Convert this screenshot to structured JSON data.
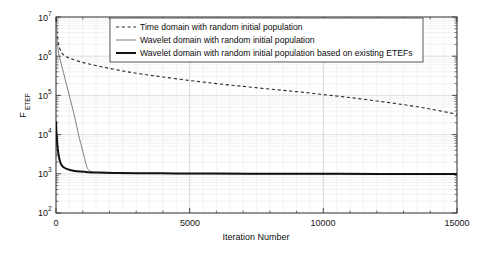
{
  "chart_data": {
    "type": "line",
    "title": "",
    "xlabel": "Iteration Number",
    "ylabel": "F_ETEF",
    "ylabel_base": "F",
    "ylabel_subscript": "ETEF",
    "xlim": [
      0,
      15000
    ],
    "ylim": [
      100,
      10000000
    ],
    "yscale": "log",
    "xscale": "linear",
    "grid": true,
    "grid_style": "minor log gridlines, light gray",
    "xticks": [
      0,
      5000,
      10000,
      15000
    ],
    "xticklabels": [
      "0",
      "5000",
      "10000",
      "15000"
    ],
    "yticks": [
      100,
      1000,
      10000,
      100000,
      1000000,
      10000000
    ],
    "yticklabels": [
      "10^2",
      "10^3",
      "10^4",
      "10^5",
      "10^6",
      "10^7"
    ],
    "ytick_mantissa": "10",
    "ytick_exponents": [
      "2",
      "3",
      "4",
      "5",
      "6",
      "7"
    ],
    "legend_position": "top-center-left",
    "series": [
      {
        "name": "Time domain with random initial population",
        "style": "dashed",
        "color": "#2a2a2a",
        "x": [
          0,
          60,
          150,
          300,
          500,
          800,
          1200,
          1800,
          2500,
          3200,
          4000,
          5000,
          6000,
          7000,
          8000,
          9000,
          10000,
          11000,
          12000,
          13000,
          14000,
          15000
        ],
        "y": [
          9000000,
          3000000,
          1500000,
          1050000,
          900000,
          760000,
          640000,
          520000,
          420000,
          350000,
          295000,
          240000,
          200000,
          170000,
          145000,
          125000,
          105000,
          88000,
          72000,
          58000,
          45000,
          33000
        ]
      },
      {
        "name": "Wavelet domain with random initial population",
        "style": "solid-thin",
        "color": "#7d7d7d",
        "x": [
          0,
          40,
          100,
          180,
          280,
          400,
          550,
          700,
          850,
          950,
          1050,
          1130,
          1200,
          1300,
          1500,
          2000,
          3000,
          5000,
          8000,
          11000,
          15000
        ],
        "y": [
          7000000,
          2600000,
          1200000,
          700000,
          380000,
          180000,
          72000,
          28000,
          9500,
          5200,
          2800,
          1700,
          1300,
          1150,
          1080,
          1040,
          1020,
          1005,
          995,
          985,
          975
        ]
      },
      {
        "name": "Wavelet domain with random initial population based on existing ETEFs",
        "style": "solid-thick",
        "color": "#121212",
        "x": [
          0,
          20,
          45,
          80,
          120,
          170,
          230,
          300,
          400,
          520,
          700,
          900,
          1200,
          1600,
          2200,
          3000,
          4500,
          6000,
          8000,
          10000,
          12000,
          15000
        ],
        "y": [
          22000,
          11000,
          6000,
          3600,
          2500,
          1900,
          1600,
          1450,
          1330,
          1250,
          1180,
          1140,
          1100,
          1075,
          1055,
          1040,
          1025,
          1015,
          1005,
          998,
          992,
          985
        ]
      }
    ],
    "annotations": []
  },
  "legend": {
    "entries": [
      {
        "label": "Time domain with random initial population"
      },
      {
        "label": "Wavelet domain with random initial population"
      },
      {
        "label": "Wavelet domain with random initial population based on existing ETEFs"
      }
    ]
  }
}
